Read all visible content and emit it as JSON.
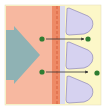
{
  "diagram": {
    "type": "membrane-transport",
    "regions": [
      {
        "name": "extracellular-side",
        "color": "#f7b8a0"
      },
      {
        "name": "barrier",
        "color": "#ee8a66",
        "dash_color": "#d9603e"
      },
      {
        "name": "inner-strip",
        "color": "#dcdcf0"
      },
      {
        "name": "cell-side",
        "color": "#fcf7c8"
      }
    ],
    "flow_arrow": {
      "color": "#8fb2b4",
      "direction": "right"
    },
    "cells": [
      {
        "color": "#d6d2f0",
        "stroke": "#8e86b8"
      },
      {
        "color": "#d6d2f0",
        "stroke": "#8e86b8"
      },
      {
        "color": "#d6d2f0",
        "stroke": "#8e86b8"
      }
    ],
    "molecules": [
      {
        "from": [
          42,
          39
        ],
        "to": [
          88,
          39
        ],
        "color": "#2e7d32"
      },
      {
        "from": [
          42,
          72
        ],
        "to": [
          97,
          73
        ],
        "color": "#2e7d32"
      }
    ],
    "arrow_color": "#333333"
  }
}
